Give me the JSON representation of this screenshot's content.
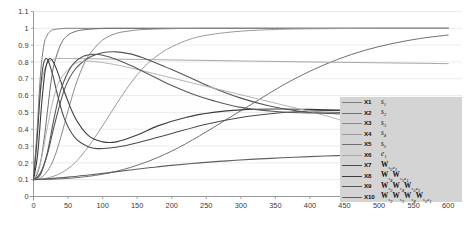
{
  "chart_data": {
    "type": "line",
    "title": "",
    "xlabel": "",
    "ylabel": "",
    "xlim": [
      0,
      620
    ],
    "ylim": [
      0,
      1.1
    ],
    "grid": true,
    "gridlines": "horizontal",
    "legend_position": "center-right",
    "x_ticks": [
      0,
      50,
      100,
      150,
      200,
      250,
      300,
      350,
      400,
      450,
      500,
      550,
      600
    ],
    "y_ticks": [
      0,
      0.1,
      0.2,
      0.3,
      0.4,
      0.5,
      0.6,
      0.7,
      0.8,
      0.9,
      1,
      1.1
    ],
    "y_tick_labels": [
      "0",
      "0.1",
      "0.2",
      "0.3",
      "0.4",
      "0.5",
      "0.6",
      "0.7",
      "0.8",
      "0.9",
      "1",
      "1.1"
    ],
    "x_tick_labels": [
      "0",
      "50",
      "100",
      "150",
      "200",
      "250",
      "300",
      "350",
      "400",
      "450",
      "500",
      "550",
      "600"
    ],
    "series": [
      {
        "key": "X1",
        "expr_html": "<i>s</i><sub>1</sub>",
        "expr_text": "s1",
        "color": "#7d7d7d",
        "width": 1.0,
        "x": [
          0,
          5,
          10,
          15,
          20,
          25,
          30,
          40,
          50,
          70,
          100,
          150,
          200,
          250,
          300,
          350,
          400,
          450,
          500,
          550,
          600
        ],
        "values": [
          0.1,
          0.38,
          0.72,
          0.9,
          0.96,
          0.985,
          0.993,
          0.998,
          1.0,
          1.0,
          1.0,
          1.0,
          1.0,
          1.0,
          1.0,
          1.0,
          1.0,
          1.0,
          1.0,
          1.0,
          1.0
        ]
      },
      {
        "key": "X2",
        "expr_html": "<i>s</i><sub>2</sub>",
        "expr_text": "s2",
        "color": "#6e6e6e",
        "width": 1.0,
        "x": [
          0,
          5,
          10,
          15,
          20,
          25,
          30,
          40,
          50,
          60,
          70,
          90,
          110,
          150,
          200,
          250,
          300,
          400,
          500,
          600
        ],
        "values": [
          0.1,
          0.13,
          0.2,
          0.33,
          0.5,
          0.67,
          0.79,
          0.91,
          0.96,
          0.98,
          0.99,
          0.997,
          1.0,
          1.0,
          1.0,
          1.0,
          1.0,
          1.0,
          1.0,
          1.0
        ]
      },
      {
        "key": "X3",
        "expr_html": "<i>s</i><sub>3</sub>",
        "expr_text": "s3",
        "color": "#8a8a8a",
        "width": 1.0,
        "x": [
          0,
          10,
          20,
          30,
          40,
          50,
          60,
          70,
          80,
          100,
          120,
          140,
          160,
          200,
          250,
          300,
          400,
          500,
          600
        ],
        "values": [
          0.1,
          0.11,
          0.15,
          0.23,
          0.36,
          0.51,
          0.65,
          0.76,
          0.84,
          0.93,
          0.97,
          0.985,
          0.993,
          0.998,
          1.0,
          1.0,
          1.0,
          1.0,
          1.0
        ]
      },
      {
        "key": "X4",
        "expr_html": "<i>s</i><sub>4</sub>",
        "expr_text": "s4",
        "color": "#9a9a9a",
        "width": 1.0,
        "x": [
          0,
          20,
          40,
          60,
          80,
          100,
          120,
          140,
          160,
          180,
          200,
          230,
          260,
          300,
          350,
          400,
          500,
          600
        ],
        "values": [
          0.1,
          0.11,
          0.14,
          0.2,
          0.3,
          0.42,
          0.55,
          0.67,
          0.77,
          0.84,
          0.89,
          0.94,
          0.965,
          0.983,
          0.993,
          0.997,
          1.0,
          1.0
        ]
      },
      {
        "key": "X5",
        "expr_html": "<i>s</i><sub>5</sub>",
        "expr_text": "s5",
        "color": "#707070",
        "width": 1.0,
        "x": [
          0,
          40,
          80,
          120,
          160,
          200,
          240,
          280,
          320,
          360,
          400,
          440,
          480,
          520,
          560,
          600
        ],
        "values": [
          0.1,
          0.105,
          0.12,
          0.15,
          0.2,
          0.27,
          0.36,
          0.46,
          0.56,
          0.66,
          0.745,
          0.815,
          0.87,
          0.91,
          0.94,
          0.96
        ]
      },
      {
        "key": "X6",
        "expr_html": "<i>e</i><sub>1</sub>",
        "expr_text": "e1",
        "color": "#a8a8a8",
        "width": 1.0,
        "x": [
          0,
          5,
          10,
          15,
          20,
          25,
          30,
          40,
          60,
          100,
          200,
          300,
          400,
          500,
          600
        ],
        "values": [
          0.1,
          0.35,
          0.62,
          0.74,
          0.79,
          0.81,
          0.818,
          0.821,
          0.82,
          0.818,
          0.812,
          0.806,
          0.8,
          0.795,
          0.79
        ]
      },
      {
        "key": "X7",
        "expr_html": "<b>W</b><sub>s<sub>5</sub>e<sub>1</sub></sub>",
        "expr_text": "W_{s5e1}",
        "color": "#4a4a4a",
        "width": 1.1,
        "x": [
          0,
          5,
          10,
          14,
          18,
          22,
          28,
          35,
          45,
          60,
          80,
          100,
          130,
          160,
          200,
          250,
          300,
          350,
          400,
          450,
          500,
          550,
          600
        ],
        "values": [
          0.1,
          0.33,
          0.63,
          0.78,
          0.82,
          0.8,
          0.72,
          0.6,
          0.46,
          0.35,
          0.295,
          0.285,
          0.3,
          0.33,
          0.375,
          0.43,
          0.47,
          0.495,
          0.508,
          0.512,
          0.51,
          0.505,
          0.5
        ]
      },
      {
        "key": "X8",
        "expr_html": "<b>W</b><sub>s<sub>4</sub></sub><b>W</b><sub>s<sub>5</sub>e<sub>1</sub></sub>",
        "expr_text": "W_{s4}W_{s5e1}",
        "color": "#3c3c3c",
        "width": 1.1,
        "x": [
          0,
          6,
          12,
          17,
          22,
          27,
          34,
          45,
          60,
          80,
          100,
          120,
          150,
          180,
          220,
          260,
          300,
          350,
          400,
          450,
          500,
          550,
          600
        ],
        "values": [
          0.1,
          0.25,
          0.56,
          0.75,
          0.815,
          0.81,
          0.75,
          0.62,
          0.47,
          0.36,
          0.325,
          0.325,
          0.365,
          0.42,
          0.47,
          0.5,
          0.515,
          0.52,
          0.518,
          0.512,
          0.505,
          0.5,
          0.497
        ]
      },
      {
        "key": "X9",
        "expr_html": "<b>W</b><sub>s<sub>3</sub></sub><b>W</b><sub>s<sub>4</sub></sub><b>W</b><sub>s<sub>5</sub>e<sub>1</sub></sub>",
        "expr_text": "W_{s3}W_{s4}W_{s5e1}",
        "color": "#555555",
        "width": 1.1,
        "x": [
          0,
          10,
          20,
          30,
          45,
          60,
          80,
          100,
          120,
          140,
          160,
          180,
          200,
          230,
          260,
          300,
          340,
          380,
          420,
          460,
          500,
          550,
          600
        ],
        "values": [
          0.1,
          0.14,
          0.25,
          0.42,
          0.64,
          0.755,
          0.825,
          0.855,
          0.86,
          0.848,
          0.822,
          0.79,
          0.755,
          0.7,
          0.645,
          0.585,
          0.54,
          0.51,
          0.495,
          0.49,
          0.492,
          0.498,
          0.505
        ]
      },
      {
        "key": "X10",
        "expr_html": "<b>W</b><sub>s<sub>2</sub></sub><b>W</b><sub>s<sub>3</sub></sub><b>W</b><sub>s<sub>4</sub></sub><b>W</b><sub>s<sub>5</sub>e<sub>1</sub></sub>",
        "expr_text": "W_{s2}W_{s3}W_{s4}W_{s5e1}",
        "color": "#606060",
        "width": 1.1,
        "x": [
          0,
          20,
          50,
          80,
          110,
          140,
          170,
          200,
          240,
          280,
          320,
          360,
          400,
          440,
          480,
          520,
          560,
          600
        ],
        "values": [
          0.1,
          0.105,
          0.115,
          0.128,
          0.142,
          0.158,
          0.172,
          0.185,
          0.2,
          0.212,
          0.222,
          0.23,
          0.237,
          0.243,
          0.248,
          0.252,
          0.255,
          0.258
        ]
      },
      {
        "key": "X11",
        "expr_html": "",
        "expr_text": "",
        "color": "#b4b4b4",
        "width": 1.0,
        "hidden_from_legend": true,
        "x": [
          0,
          10,
          20,
          30,
          40,
          60,
          80,
          110,
          140,
          170,
          200,
          240,
          280,
          320,
          360,
          400,
          440,
          480,
          520,
          560,
          600
        ],
        "values": [
          0.1,
          0.2,
          0.41,
          0.6,
          0.705,
          0.79,
          0.805,
          0.79,
          0.765,
          0.735,
          0.705,
          0.665,
          0.625,
          0.585,
          0.545,
          0.505,
          0.46,
          0.4,
          0.31,
          0.2,
          0.09
        ]
      },
      {
        "key": "X12",
        "expr_html": "",
        "expr_text": "",
        "color": "#5a5a5a",
        "width": 1.1,
        "hidden_from_legend": true,
        "x": [
          0,
          10,
          20,
          30,
          40,
          55,
          70,
          85,
          100,
          120,
          140,
          160,
          180,
          200,
          230,
          260,
          300,
          350,
          400,
          450,
          500,
          550,
          600
        ],
        "values": [
          0.1,
          0.13,
          0.26,
          0.47,
          0.64,
          0.775,
          0.83,
          0.845,
          0.84,
          0.815,
          0.78,
          0.74,
          0.7,
          0.66,
          0.61,
          0.57,
          0.53,
          0.505,
          0.497,
          0.5,
          0.508,
          0.515,
          0.52
        ]
      }
    ]
  }
}
